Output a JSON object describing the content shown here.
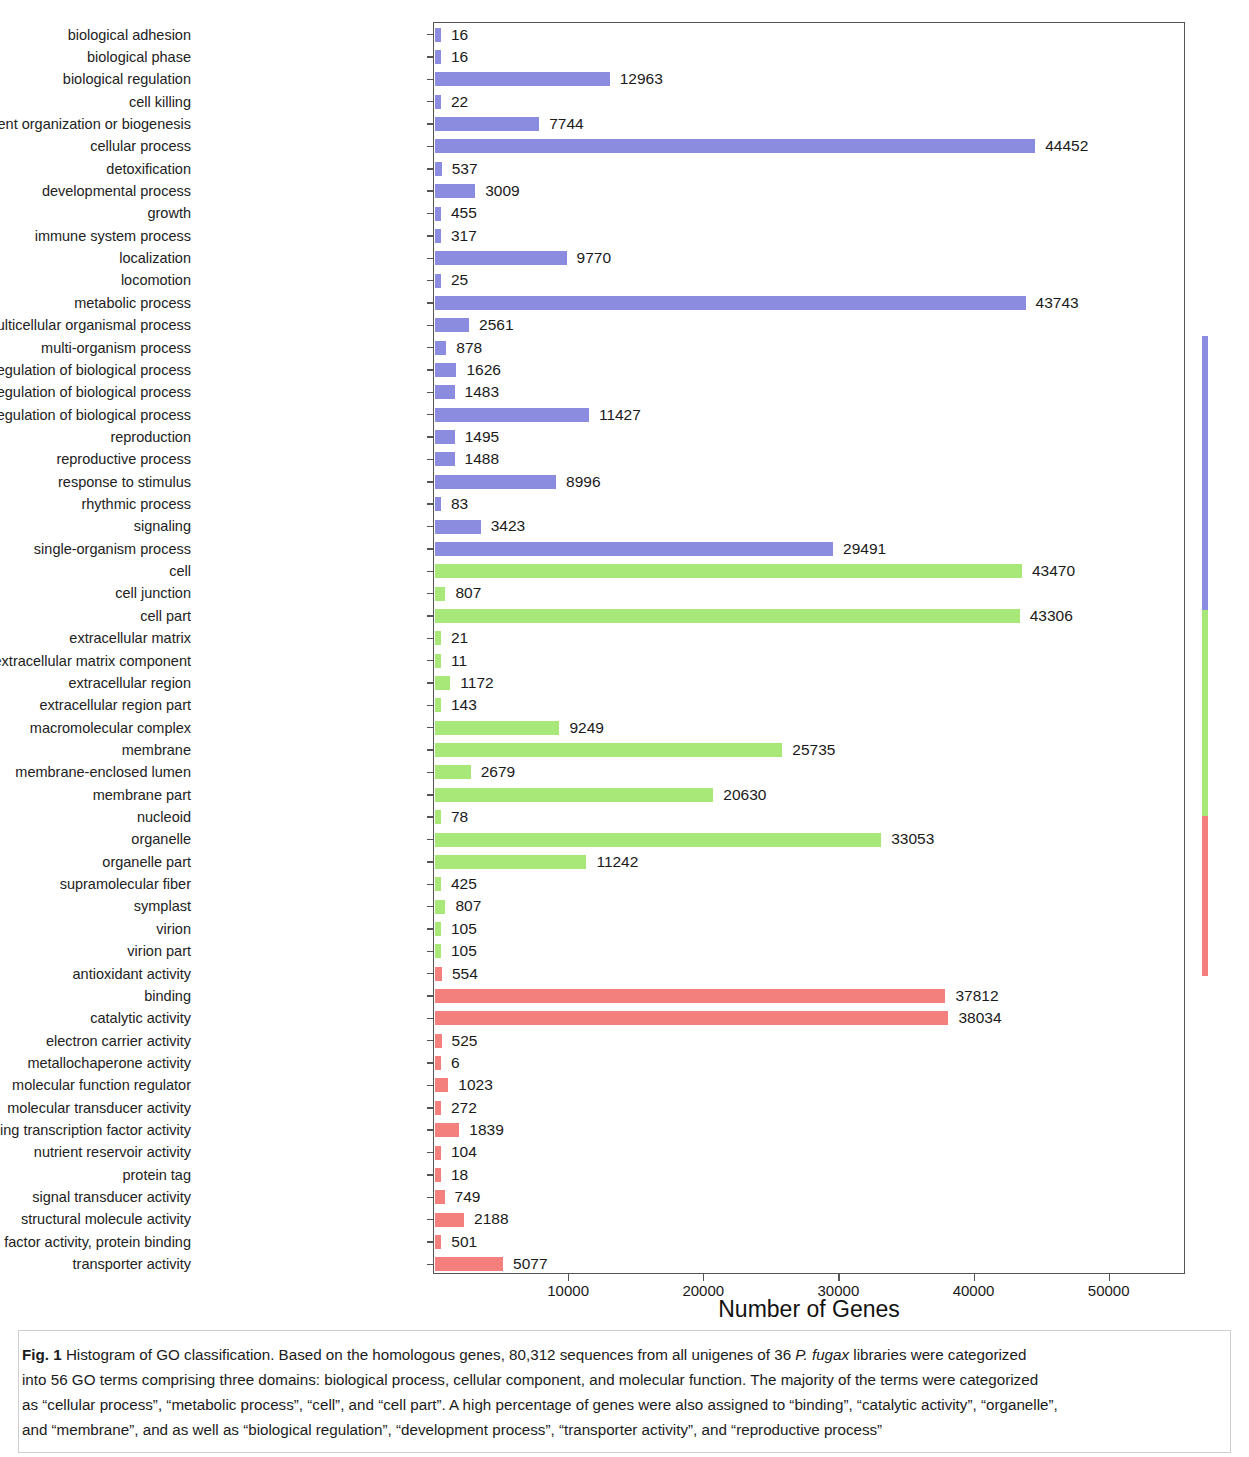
{
  "chart_data": {
    "type": "bar",
    "orientation": "horizontal",
    "title": "",
    "xlabel": "Number of Genes",
    "ylabel": "",
    "xlim": [
      0,
      55500
    ],
    "xticks": [
      10000,
      20000,
      30000,
      40000,
      50000
    ],
    "xtick_labels": [
      "10000",
      "20000",
      "30000",
      "40000",
      "50000"
    ],
    "grid": false,
    "legend_position": "right-outside",
    "categories": [
      "biological adhesion",
      "biological phase",
      "biological regulation",
      "cell killing",
      "cellular component organization or biogenesis",
      "cellular process",
      "detoxification",
      "developmental process",
      "growth",
      "immune system process",
      "localization",
      "locomotion",
      "metabolic process",
      "multicellular organismal process",
      "multi-organism process",
      "negative regulation of biological process",
      "positive regulation of biological process",
      "regulation of biological process",
      "reproduction",
      "reproductive process",
      "response to stimulus",
      "rhythmic process",
      "signaling",
      "single-organism process",
      "cell",
      "cell junction",
      "cell part",
      "extracellular matrix",
      "extracellular matrix component",
      "extracellular region",
      "extracellular region part",
      "macromolecular complex",
      "membrane",
      "membrane-enclosed lumen",
      "membrane part",
      "nucleoid",
      "organelle",
      "organelle part",
      "supramolecular fiber",
      "symplast",
      "virion",
      "virion part",
      "antioxidant activity",
      "binding",
      "catalytic activity",
      "electron carrier activity",
      "metallochaperone activity",
      "molecular function regulator",
      "molecular transducer activity",
      "nucleic acid binding transcription factor activity",
      "nutrient reservoir activity",
      "protein tag",
      "signal transducer activity",
      "structural molecule activity",
      "transcription factor activity, protein binding",
      "transporter activity"
    ],
    "values": [
      16,
      16,
      12963,
      22,
      7744,
      44452,
      537,
      3009,
      455,
      317,
      9770,
      25,
      43743,
      2561,
      878,
      1626,
      1483,
      11427,
      1495,
      1488,
      8996,
      83,
      3423,
      29491,
      43470,
      807,
      43306,
      21,
      11,
      1172,
      143,
      9249,
      25735,
      2679,
      20630,
      78,
      33053,
      11242,
      425,
      807,
      105,
      105,
      554,
      37812,
      38034,
      525,
      6,
      1023,
      272,
      1839,
      104,
      18,
      749,
      2188,
      501,
      5077
    ],
    "value_labels": [
      "16",
      "16",
      "12963",
      "22",
      "7744",
      "44452",
      "537",
      "3009",
      "455",
      "317",
      "9770",
      "25",
      "43743",
      "2561",
      "878",
      "1626",
      "1483",
      "11427",
      "1495",
      "1488",
      "8996",
      "83",
      "3423",
      "29491",
      "43470",
      "807",
      "43306",
      "21",
      "11",
      "1172",
      "143",
      "9249",
      "25735",
      "2679",
      "20630",
      "78",
      "33053",
      "11242",
      "425",
      "807",
      "105",
      "105",
      "554",
      "37812",
      "38034",
      "525",
      "6",
      "1023",
      "272",
      "1839",
      "104",
      "18",
      "749",
      "2188",
      "501",
      "5077"
    ],
    "series": [
      {
        "name": "biological process",
        "color": "#8b8be0",
        "start_index": 0,
        "count": 24
      },
      {
        "name": "cellular component",
        "color": "#a8e878",
        "start_index": 24,
        "count": 18
      },
      {
        "name": "molecular function",
        "color": "#f4807e",
        "start_index": 42,
        "count": 14
      }
    ],
    "legend": [
      {
        "label": "biological process",
        "color": "#8b8be0"
      },
      {
        "label": "cellular component",
        "color": "#a8e878"
      },
      {
        "label": "molecular function",
        "color": "#f4807e"
      }
    ]
  },
  "caption": {
    "figure_label": "Fig. 1",
    "line1_a": " Histogram of GO classification. Based on the homologous genes, 80,312 sequences from all unigenes of 36 ",
    "line1_italic": "P. fugax",
    "line1_b": " libraries were categorized",
    "line2": "into 56 GO terms comprising three domains: biological process, cellular component, and molecular function. The majority of the terms were categorized",
    "line3": "as “cellular process”, “metabolic process”, “cell”, and “cell part”. A high percentage of genes were also assigned to “binding”, “catalytic activity”, “organelle”,",
    "line4": "and “membrane”, and as well as “biological regulation”, “development process”, “transporter activity”, and “reproductive process”"
  }
}
